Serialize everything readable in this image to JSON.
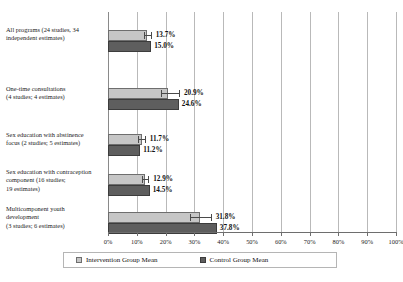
{
  "chart_data": {
    "type": "bar",
    "orientation": "horizontal",
    "title": "",
    "xlabel": "",
    "ylabel": "",
    "xlim": [
      0,
      100
    ],
    "xtick_labels": [
      "0%",
      "10%",
      "20%",
      "30%",
      "40%",
      "50%",
      "60%",
      "70%",
      "80%",
      "90%",
      "100%"
    ],
    "xticks": [
      0,
      10,
      20,
      30,
      40,
      50,
      60,
      70,
      80,
      90,
      100
    ],
    "grid": true,
    "grid_axis": "x",
    "legend_position": "bottom",
    "categories": [
      "All programs (24 studies, 34 independent estimates)",
      "One-time consultations (4 studies; 4 estimates)",
      "Sex education with abstinence focus (2 studies; 5 estimates)",
      "Sex education with contraception component (16 studies; 19 estimates)",
      "Multicomponent youth development (3 studies; 6 estimates)"
    ],
    "series": [
      {
        "name": "Intervention Group Mean",
        "color": "#c6c6c6",
        "values": [
          13.7,
          20.9,
          11.7,
          12.9,
          31.8
        ],
        "value_labels": [
          "13.7%",
          "20.9%",
          "11.7%",
          "12.9%",
          "31.8%"
        ],
        "error_low": [
          12.4,
          18.3,
          10.4,
          11.7,
          28.4
        ],
        "error_high": [
          15.2,
          25.0,
          13.1,
          14.3,
          36.0
        ]
      },
      {
        "name": "Control Group Mean",
        "color": "#5e5e5e",
        "values": [
          15.0,
          24.6,
          11.2,
          14.5,
          37.8
        ],
        "value_labels": [
          "15.0%",
          "24.6%",
          "11.2%",
          "14.5%",
          "37.8%"
        ]
      }
    ]
  },
  "category_labels": [
    {
      "lines": [
        "All programs (24 studies, 34",
        "independent estimates)"
      ]
    },
    {
      "lines": [
        "One-time consultations",
        "(4 studies; 4 estimates)"
      ]
    },
    {
      "lines": [
        "Sex education with abstinence",
        "focus (2 studies; 5 estimates)"
      ]
    },
    {
      "lines": [
        "Sex education with contraception",
        "component (16 studies;",
        "19 estimates)"
      ]
    },
    {
      "lines": [
        "Multicomponent youth",
        "development",
        "(3 studies; 6 estimates)"
      ]
    }
  ],
  "legend": {
    "intervention_label": "Intervention Group Mean",
    "control_label": "Control Group Mean"
  }
}
